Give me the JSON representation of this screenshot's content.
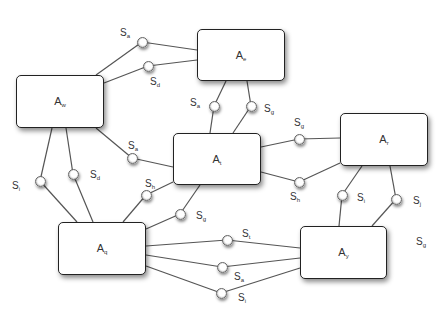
{
  "diagram": {
    "agents": [
      {
        "id": "w",
        "label": "A",
        "sub": "w",
        "x": 16,
        "y": 75,
        "w": 88,
        "h": 53
      },
      {
        "id": "e",
        "label": "A",
        "sub": "e",
        "x": 197,
        "y": 29,
        "w": 88,
        "h": 52
      },
      {
        "id": "t",
        "label": "A",
        "sub": "t",
        "x": 173,
        "y": 133,
        "w": 88,
        "h": 52
      },
      {
        "id": "r",
        "label": "A",
        "sub": "r",
        "x": 340,
        "y": 113,
        "w": 88,
        "h": 53
      },
      {
        "id": "q",
        "label": "A",
        "sub": "q",
        "x": 58,
        "y": 222,
        "w": 88,
        "h": 53
      },
      {
        "id": "y",
        "label": "A",
        "sub": "y",
        "x": 300,
        "y": 226,
        "w": 87,
        "h": 53
      }
    ],
    "sockets": [
      {
        "label": "S",
        "sub": "a",
        "cx": 142,
        "cy": 42,
        "lx": 120,
        "ly": 27,
        "links": [
          [
            96,
            75
          ],
          [
            197,
            50
          ]
        ]
      },
      {
        "label": "S",
        "sub": "d",
        "cx": 148,
        "cy": 66,
        "lx": 150,
        "ly": 76,
        "links": [
          [
            104,
            83
          ],
          [
            197,
            60
          ]
        ]
      },
      {
        "label": "S",
        "sub": "a",
        "cx": 214,
        "cy": 106,
        "lx": 190,
        "ly": 97,
        "links": [
          [
            226,
            81
          ],
          [
            210,
            133
          ]
        ]
      },
      {
        "label": "S",
        "sub": "g",
        "cx": 251,
        "cy": 106,
        "lx": 264,
        "ly": 103,
        "links": [
          [
            247,
            81
          ],
          [
            233,
            133
          ]
        ]
      },
      {
        "label": "S",
        "sub": "a",
        "cx": 132,
        "cy": 158,
        "lx": 128,
        "ly": 140,
        "links": [
          [
            96,
            128
          ],
          [
            173,
            167
          ]
        ]
      },
      {
        "label": "S",
        "sub": "g",
        "cx": 299,
        "cy": 139,
        "lx": 294,
        "ly": 117,
        "links": [
          [
            261,
            147
          ],
          [
            340,
            138
          ]
        ]
      },
      {
        "label": "S",
        "sub": "h",
        "cx": 299,
        "cy": 182,
        "lx": 290,
        "ly": 191,
        "links": [
          [
            261,
            172
          ],
          [
            340,
            163
          ]
        ]
      },
      {
        "label": "S",
        "sub": "i",
        "cx": 40,
        "cy": 181,
        "lx": 12,
        "ly": 180,
        "links": [
          [
            52,
            128
          ],
          [
            77,
            222
          ]
        ]
      },
      {
        "label": "S",
        "sub": "d",
        "cx": 73,
        "cy": 174,
        "lx": 90,
        "ly": 169,
        "links": [
          [
            66,
            128
          ],
          [
            93,
            222
          ]
        ]
      },
      {
        "label": "S",
        "sub": "h",
        "cx": 146,
        "cy": 195,
        "lx": 145,
        "ly": 178,
        "links": [
          [
            123,
            222
          ],
          [
            173,
            182
          ]
        ]
      },
      {
        "label": "S",
        "sub": "g",
        "cx": 180,
        "cy": 214,
        "lx": 196,
        "ly": 210,
        "links": [
          [
            146,
            229
          ],
          [
            200,
            185
          ]
        ]
      },
      {
        "label": "S",
        "sub": "i",
        "cx": 342,
        "cy": 195,
        "lx": 357,
        "ly": 192,
        "links": [
          [
            362,
            166
          ],
          [
            339,
            226
          ]
        ]
      },
      {
        "label": "S",
        "sub": "j",
        "cx": 396,
        "cy": 199,
        "lx": 413,
        "ly": 195,
        "links": [
          [
            390,
            166
          ],
          [
            372,
            226
          ]
        ]
      },
      {
        "label": "S",
        "sub": "t",
        "cx": 227,
        "cy": 240,
        "lx": 242,
        "ly": 228,
        "links": [
          [
            146,
            246
          ],
          [
            300,
            248
          ]
        ]
      },
      {
        "label": "S",
        "sub": "a",
        "cx": 222,
        "cy": 267,
        "lx": 234,
        "ly": 271,
        "links": [
          [
            146,
            255
          ],
          [
            300,
            258
          ]
        ]
      },
      {
        "label": "S",
        "sub": "i",
        "cx": 221,
        "cy": 293,
        "lx": 238,
        "ly": 292,
        "links": [
          [
            146,
            266
          ],
          [
            300,
            268
          ]
        ]
      },
      {
        "label": "S",
        "sub": "g",
        "cx": null,
        "cy": null,
        "lx": 416,
        "ly": 236,
        "links": []
      }
    ]
  }
}
